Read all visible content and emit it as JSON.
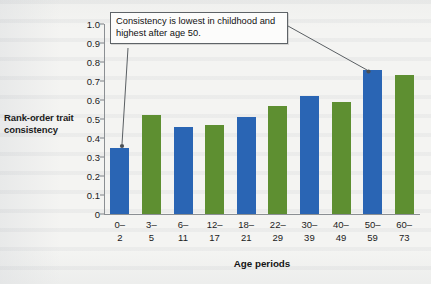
{
  "figure": {
    "callout_text": "Consistency is lowest in childhood and highest after age 50.",
    "ylabel": "Rank-order trait consistency",
    "xlabel": "Age periods"
  },
  "colors": {
    "blue": "#2a65b4",
    "green": "#5e8f31",
    "axis": "#8b8f93",
    "text": "#1b1b1b",
    "callout_border": "#5e6367",
    "page_background": "#f4f4f2"
  },
  "chart_data": {
    "type": "bar",
    "title": "",
    "subtitle": "",
    "xlabel": "Age periods",
    "ylabel": "Rank-order trait consistency",
    "categories": [
      "0–2",
      "3–5",
      "6–11",
      "12–17",
      "18–21",
      "22–29",
      "30–39",
      "40–49",
      "50–59",
      "60–73"
    ],
    "category_lines": [
      [
        "0–",
        "2"
      ],
      [
        "3–",
        "5"
      ],
      [
        "6–",
        "11"
      ],
      [
        "12–",
        "17"
      ],
      [
        "18–",
        "21"
      ],
      [
        "22–",
        "29"
      ],
      [
        "30–",
        "39"
      ],
      [
        "40–",
        "49"
      ],
      [
        "50–",
        "59"
      ],
      [
        "60–",
        "73"
      ]
    ],
    "values": [
      0.35,
      0.52,
      0.46,
      0.47,
      0.51,
      0.57,
      0.62,
      0.59,
      0.76,
      0.73
    ],
    "bar_colors": [
      "blue",
      "green",
      "blue",
      "green",
      "blue",
      "green",
      "blue",
      "green",
      "blue",
      "green"
    ],
    "ylim": [
      0,
      1.0
    ],
    "ytick_values": [
      1.0,
      0.9,
      0.8,
      0.7,
      0.6,
      0.5,
      0.4,
      0.3,
      0.2,
      0.1,
      0
    ],
    "ytick_labels": [
      "1.0",
      "0.9",
      "0.8",
      "0.7",
      "0.6",
      "0.5",
      "0.4",
      "0.3",
      "0.2",
      "0.1",
      "0"
    ],
    "grid": false,
    "legend": null,
    "annotations": [
      {
        "text": "Consistency is lowest in childhood and highest after age 50.",
        "points_to": [
          "0–2",
          "50–59"
        ]
      }
    ]
  }
}
